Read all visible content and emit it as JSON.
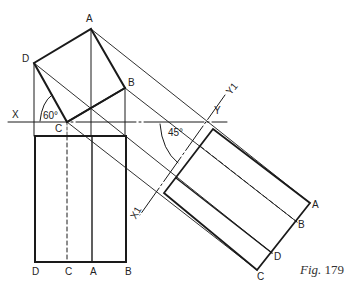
{
  "figure": {
    "caption_prefix": "Fig.",
    "caption_number": "179",
    "colors": {
      "line": "#1a1a1a",
      "background": "#ffffff"
    }
  },
  "labels": {
    "plan": {
      "A": "A",
      "B": "B",
      "C": "C",
      "D": "D"
    },
    "axis": {
      "X": "X",
      "Y": "Y",
      "X1": "X1",
      "Y1": "Y1"
    },
    "angles": {
      "plan_angle": "60°",
      "aux_angle": "45°"
    },
    "front": {
      "D": "D",
      "C": "C",
      "A": "A",
      "B": "B"
    },
    "aux": {
      "A": "A",
      "B": "B",
      "D": "D",
      "C": "C"
    }
  }
}
